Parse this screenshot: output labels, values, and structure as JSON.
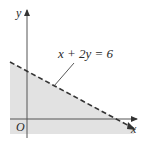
{
  "diagram": {
    "type": "linear-inequality-region",
    "equation_label": "x + 2y = 6",
    "line_style": "dashed",
    "shaded_region": "below line",
    "axes": {
      "x_label": "x",
      "y_label": "y",
      "origin_label": "O"
    },
    "colors": {
      "shading": "#e2e2e2",
      "axis": "#555555",
      "line": "#333333"
    }
  }
}
